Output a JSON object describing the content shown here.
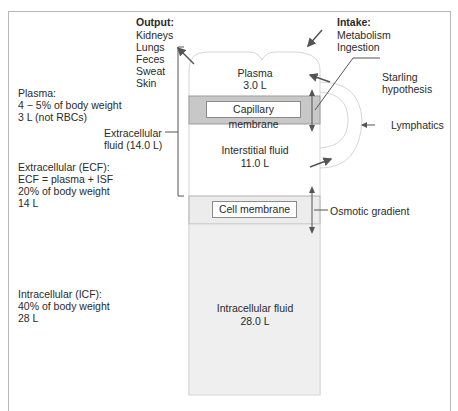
{
  "output": {
    "title": "Output:",
    "items": [
      "Kidneys",
      "Lungs",
      "Feces",
      "Sweat",
      "Skin"
    ]
  },
  "intake": {
    "title": "Intake:",
    "items": [
      "Metabolism",
      "Ingestion"
    ]
  },
  "compartments": {
    "plasma": {
      "name": "Plasma",
      "volume": "3.0 L"
    },
    "interstitial": {
      "name": "Interstitial fluid",
      "volume": "11.0 L"
    },
    "intracellular": {
      "name": "Intracellular fluid",
      "volume": "28.0 L"
    }
  },
  "membranes": {
    "capillary": "Capillary membrane",
    "cell": "Cell membrane"
  },
  "annotations": {
    "starling": [
      "Starling",
      "hypothesis"
    ],
    "lymphatics": "Lymphatics",
    "osmotic": "Osmotic gradient",
    "ecf_bracket": [
      "Extracellular",
      "fluid (14.0 L)"
    ]
  },
  "left_notes": {
    "plasma": [
      "Plasma:",
      "4 − 5% of body weight",
      "3 L (not RBCs)"
    ],
    "ecf": [
      "Extracellular (ECF):",
      "ECF = plasma + ISF",
      "20% of body weight",
      "14 L"
    ],
    "icf": [
      "Intracellular (ICF):",
      "40% of body weight",
      "28 L"
    ]
  },
  "colors": {
    "capillary_band": "#c8c8c8",
    "cell_band": "#ececec",
    "icf_fill": "#efefef",
    "outline": "#d0d0d0",
    "arrow": "#555555"
  }
}
